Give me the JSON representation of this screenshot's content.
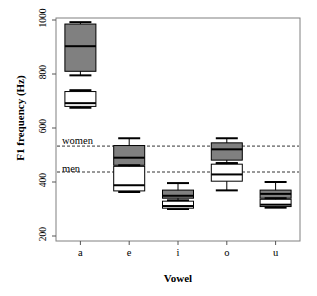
{
  "chart_data": {
    "type": "boxplot",
    "title": "",
    "xlabel": "Vowel",
    "ylabel": "F1 frequency (Hz)",
    "categories": [
      "a",
      "e",
      "i",
      "o",
      "u"
    ],
    "ylim": [
      200,
      1000
    ],
    "yticks": [
      200,
      400,
      600,
      800,
      1000
    ],
    "ytick_labels": [
      "200",
      "400",
      "600",
      "800",
      "1000"
    ],
    "grid": false,
    "legend": "none",
    "colors": {
      "women_box_fill": "#808080",
      "men_box_fill": "#ffffff",
      "outline": "#000000",
      "reference_line": "#333333",
      "frame": "#808080",
      "background": "#ffffff"
    },
    "reference_lines": [
      {
        "label": "women",
        "value": 533
      },
      {
        "label": "men",
        "value": 437
      }
    ],
    "series": [
      {
        "name": "women",
        "fill": "#808080",
        "boxes": [
          {
            "category": "a",
            "whisker_low": 795,
            "q1": 810,
            "median": 903,
            "q3": 985,
            "whisker_high": 992
          },
          {
            "category": "e",
            "whisker_low": 452,
            "q1": 462,
            "median": 490,
            "q3": 535,
            "whisker_high": 562
          },
          {
            "category": "i",
            "whisker_low": 330,
            "q1": 340,
            "median": 349,
            "q3": 370,
            "whisker_high": 396
          },
          {
            "category": "o",
            "whisker_low": 469,
            "q1": 481,
            "median": 521,
            "q3": 545,
            "whisker_high": 562
          },
          {
            "category": "u",
            "whisker_low": 330,
            "q1": 340,
            "median": 356,
            "q3": 370,
            "whisker_high": 400
          }
        ]
      },
      {
        "name": "men",
        "fill": "#ffffff",
        "boxes": [
          {
            "category": "a",
            "whisker_low": 675,
            "q1": 680,
            "median": 692,
            "q3": 735,
            "whisker_high": 740
          },
          {
            "category": "e",
            "whisker_low": 363,
            "q1": 367,
            "median": 388,
            "q3": 458,
            "whisker_high": 462
          },
          {
            "category": "i",
            "whisker_low": 300,
            "q1": 303,
            "median": 311,
            "q3": 329,
            "whisker_high": 332
          },
          {
            "category": "o",
            "whisker_low": 369,
            "q1": 403,
            "median": 428,
            "q3": 466,
            "whisker_high": 470
          },
          {
            "category": "u",
            "whisker_low": 305,
            "q1": 309,
            "median": 316,
            "q3": 336,
            "whisker_high": 340
          }
        ]
      }
    ]
  },
  "axis": {
    "y_title": "F1 frequency (Hz)",
    "x_title": "Vowel",
    "y_ticks": [
      "200",
      "400",
      "600",
      "800",
      "1000"
    ],
    "x_ticks": [
      "a",
      "e",
      "i",
      "o",
      "u"
    ]
  },
  "annotations": {
    "women_label": "women",
    "men_label": "men"
  }
}
